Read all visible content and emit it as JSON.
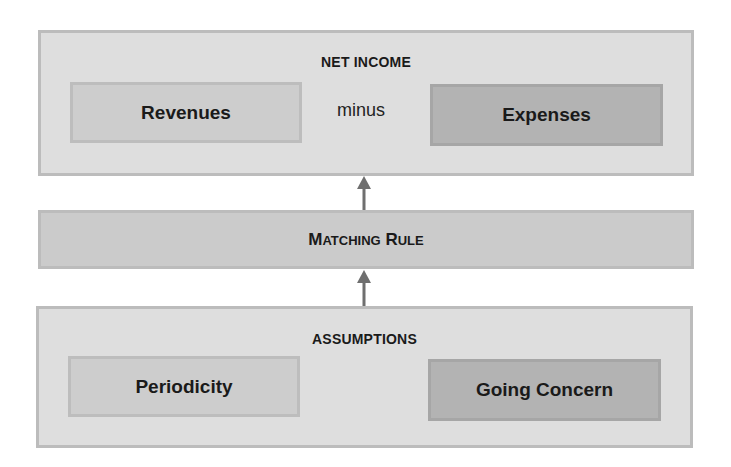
{
  "net_income": {
    "title": "NET INCOME",
    "left": "Revenues",
    "operator": "minus",
    "right": "Expenses"
  },
  "matching_rule": {
    "first_cap": "M",
    "rest": "ATCHING",
    "second_cap": "R",
    "rest2": "ULE",
    "full": "Matching Rule"
  },
  "assumptions": {
    "title": "ASSUMPTIONS",
    "left": "Periodicity",
    "right": "Going Concern"
  },
  "colors": {
    "outer_fill": "#dedede",
    "outer_border": "#bcbcbc",
    "light_box": "#cdcdcd",
    "dark_box": "#b3b3b3",
    "arrow": "#6f6f6f"
  },
  "arrows": [
    {
      "from": "matching_rule",
      "to": "net_income"
    },
    {
      "from": "assumptions",
      "to": "matching_rule"
    }
  ]
}
